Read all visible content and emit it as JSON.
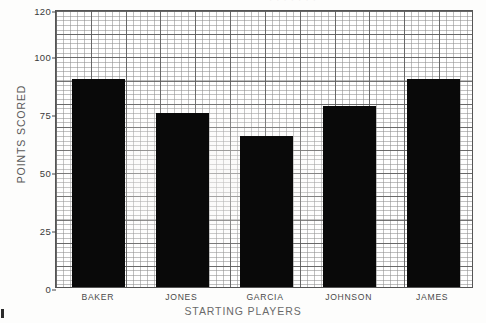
{
  "chart_data": {
    "type": "bar",
    "title": "",
    "title_partial": "· · · · · · ·",
    "xlabel": "STARTING PLAYERS",
    "ylabel": "POINTS SCORED",
    "categories": [
      "BAKER",
      "JONES",
      "GARCIA",
      "JOHNSON",
      "JAMES"
    ],
    "values": [
      90,
      75,
      65,
      78,
      90
    ],
    "ylim": [
      0,
      120
    ],
    "yticks": [
      0,
      25,
      50,
      75,
      100,
      120
    ],
    "ytick_labels": [
      "0",
      "25",
      "50",
      "75",
      "100",
      "120"
    ],
    "grid": true,
    "grid_style": "fine graph-paper grid with heavy lines every 5 cells",
    "legend": "none",
    "bar_color": "#090909",
    "axis_color": "#555555",
    "background": "#ffffff"
  },
  "figure": {
    "media": "scanned printed graph paper chart",
    "bar_count": 5
  }
}
